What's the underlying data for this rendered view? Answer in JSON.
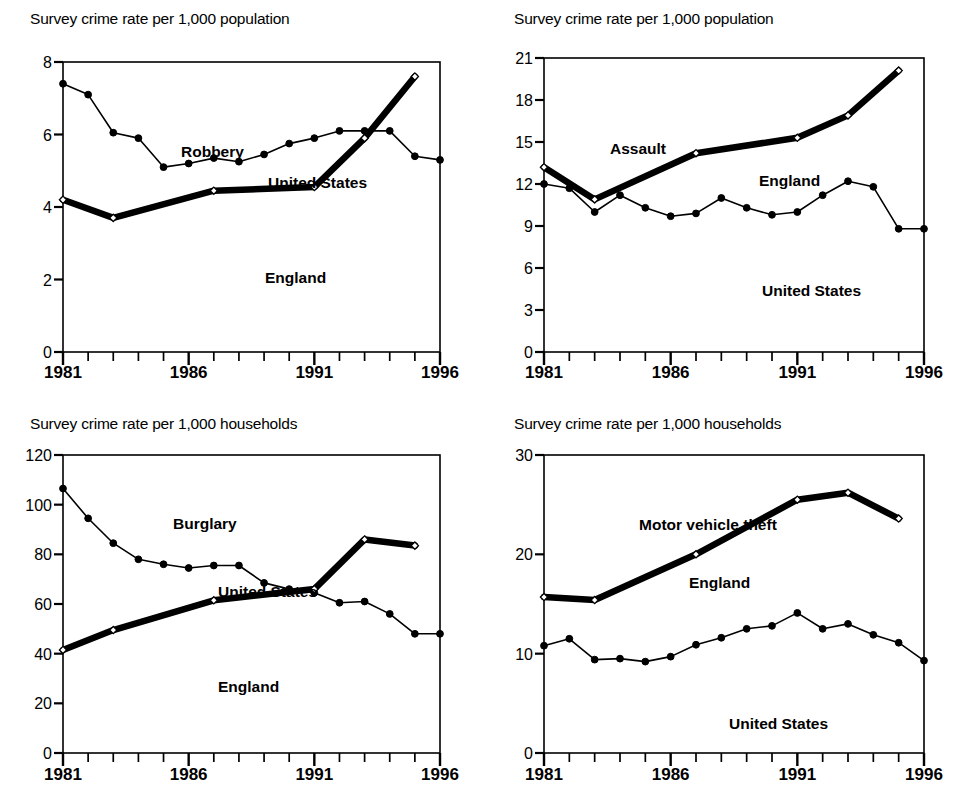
{
  "figure": {
    "background": "#ffffff",
    "ink": "#000000"
  },
  "panels": [
    {
      "id": "robbery",
      "axis_title": "Survey crime rate per 1,000 population",
      "heading": "Robbery",
      "labels": {
        "us": "United States",
        "england": "England"
      },
      "label_pos": {
        "heading_x": 118,
        "heading_y": 95,
        "us_x": 205,
        "us_y": 126,
        "england_x": 202,
        "england_y": 221
      }
    },
    {
      "id": "assault",
      "axis_title": "Survey crime rate per 1,000 population",
      "heading": "Assault",
      "labels": {
        "us": "United States",
        "england": "England"
      },
      "label_pos": {
        "heading_x": 66,
        "heading_y": 96,
        "england_x": 215,
        "england_y": 128,
        "us_x": 218,
        "us_y": 238
      }
    },
    {
      "id": "burglary",
      "axis_title": "Survey crime rate per 1,000 households",
      "heading": "Burglary",
      "labels": {
        "us": "United States",
        "england": "England"
      },
      "label_pos": {
        "heading_x": 110,
        "heading_y": 74,
        "us_x": 155,
        "us_y": 142,
        "england_x": 155,
        "england_y": 237
      }
    },
    {
      "id": "mvtheft",
      "axis_title": "Survey crime rate per 1,000 households",
      "heading": "Motor vehicle theft",
      "labels": {
        "us": "United States",
        "england": "England"
      },
      "label_pos": {
        "heading_x": 95,
        "heading_y": 75,
        "england_x": 145,
        "england_y": 133,
        "us_x": 185,
        "us_y": 274
      }
    }
  ],
  "chart_data": [
    {
      "type": "line",
      "id": "robbery",
      "title": "Robbery",
      "ylabel": "Survey crime rate per 1,000 population",
      "xlabel": "",
      "xlim": [
        1981,
        1996
      ],
      "ylim": [
        0,
        8
      ],
      "yticks": [
        0,
        2,
        4,
        6,
        8
      ],
      "xticks": [
        1981,
        1982,
        1983,
        1984,
        1985,
        1986,
        1987,
        1988,
        1989,
        1990,
        1991,
        1992,
        1993,
        1994,
        1995,
        1996
      ],
      "xticklabels": [
        "1981",
        "",
        "",
        "",
        "",
        "1986",
        "",
        "",
        "",
        "",
        "1991",
        "",
        "",
        "",
        "",
        "1996"
      ],
      "grid": false,
      "legend": "inline-annotations",
      "series": [
        {
          "name": "United States",
          "marker": "filled-circle",
          "line": "thin",
          "x": [
            1981,
            1982,
            1983,
            1984,
            1985,
            1986,
            1987,
            1988,
            1989,
            1990,
            1991,
            1992,
            1993,
            1994,
            1995,
            1996
          ],
          "values": [
            7.4,
            7.1,
            6.05,
            5.9,
            5.1,
            5.2,
            5.35,
            5.25,
            5.45,
            5.75,
            5.9,
            6.1,
            6.1,
            6.1,
            5.4,
            5.3
          ]
        },
        {
          "name": "England",
          "marker": "open-diamond",
          "line": "thick",
          "x": [
            1981,
            1983,
            1987,
            1991,
            1993,
            1995
          ],
          "values": [
            4.2,
            3.7,
            4.45,
            4.55,
            5.9,
            7.6
          ]
        }
      ]
    },
    {
      "type": "line",
      "id": "assault",
      "title": "Assault",
      "ylabel": "Survey crime rate per 1,000 population",
      "xlabel": "",
      "xlim": [
        1981,
        1996
      ],
      "ylim": [
        0,
        21
      ],
      "yticks": [
        0,
        3,
        6,
        9,
        12,
        15,
        18,
        21
      ],
      "xticks": [
        1981,
        1982,
        1983,
        1984,
        1985,
        1986,
        1987,
        1988,
        1989,
        1990,
        1991,
        1992,
        1993,
        1994,
        1995,
        1996
      ],
      "xticklabels": [
        "1981",
        "",
        "",
        "",
        "",
        "1986",
        "",
        "",
        "",
        "",
        "1991",
        "",
        "",
        "",
        "",
        "1996"
      ],
      "grid": false,
      "legend": "inline-annotations",
      "series": [
        {
          "name": "United States",
          "marker": "filled-circle",
          "line": "thin",
          "x": [
            1981,
            1982,
            1983,
            1984,
            1985,
            1986,
            1987,
            1988,
            1989,
            1990,
            1991,
            1992,
            1993,
            1994,
            1995,
            1996
          ],
          "values": [
            12.0,
            11.7,
            10.0,
            11.2,
            10.3,
            9.7,
            9.9,
            11.0,
            10.3,
            9.8,
            10.0,
            11.2,
            12.2,
            11.8,
            8.8,
            8.8
          ]
        },
        {
          "name": "England",
          "marker": "open-diamond",
          "line": "thick",
          "x": [
            1981,
            1983,
            1987,
            1991,
            1993,
            1995
          ],
          "values": [
            13.2,
            10.9,
            14.2,
            15.3,
            16.9,
            20.1
          ]
        }
      ]
    },
    {
      "type": "line",
      "id": "burglary",
      "title": "Burglary",
      "ylabel": "Survey crime rate per 1,000 households",
      "xlabel": "",
      "xlim": [
        1981,
        1996
      ],
      "ylim": [
        0,
        120
      ],
      "yticks": [
        0,
        20,
        40,
        60,
        80,
        100,
        120
      ],
      "xticks": [
        1981,
        1982,
        1983,
        1984,
        1985,
        1986,
        1987,
        1988,
        1989,
        1990,
        1991,
        1992,
        1993,
        1994,
        1995,
        1996
      ],
      "xticklabels": [
        "1981",
        "",
        "",
        "",
        "",
        "1986",
        "",
        "",
        "",
        "",
        "1991",
        "",
        "",
        "",
        "",
        "1996"
      ],
      "grid": false,
      "legend": "inline-annotations",
      "series": [
        {
          "name": "United States",
          "marker": "filled-circle",
          "line": "thin",
          "x": [
            1981,
            1982,
            1983,
            1984,
            1985,
            1986,
            1987,
            1988,
            1989,
            1990,
            1991,
            1992,
            1993,
            1994,
            1995,
            1996
          ],
          "values": [
            106.5,
            94.5,
            84.5,
            78.0,
            76.0,
            74.5,
            75.5,
            75.5,
            68.5,
            66.0,
            64.5,
            60.5,
            61.0,
            56.0,
            48.0,
            48.0
          ]
        },
        {
          "name": "England",
          "marker": "open-diamond",
          "line": "thick",
          "x": [
            1981,
            1983,
            1987,
            1991,
            1993,
            1995
          ],
          "values": [
            41.5,
            49.5,
            61.5,
            66.0,
            86.0,
            83.5
          ]
        }
      ]
    },
    {
      "type": "line",
      "id": "mvtheft",
      "title": "Motor vehicle theft",
      "ylabel": "Survey crime rate per 1,000 households",
      "xlabel": "",
      "xlim": [
        1981,
        1996
      ],
      "ylim": [
        0,
        30
      ],
      "yticks": [
        0,
        10,
        20,
        30
      ],
      "xticks": [
        1981,
        1982,
        1983,
        1984,
        1985,
        1986,
        1987,
        1988,
        1989,
        1990,
        1991,
        1992,
        1993,
        1994,
        1995,
        1996
      ],
      "xticklabels": [
        "1981",
        "",
        "",
        "",
        "",
        "1986",
        "",
        "",
        "",
        "",
        "1991",
        "",
        "",
        "",
        "",
        "1996"
      ],
      "grid": false,
      "legend": "inline-annotations",
      "series": [
        {
          "name": "United States",
          "marker": "filled-circle",
          "line": "thin",
          "x": [
            1981,
            1982,
            1983,
            1984,
            1985,
            1986,
            1987,
            1988,
            1989,
            1990,
            1991,
            1992,
            1993,
            1994,
            1995,
            1996
          ],
          "values": [
            10.8,
            11.5,
            9.4,
            9.5,
            9.2,
            9.7,
            10.9,
            11.6,
            12.5,
            12.8,
            14.1,
            12.5,
            13.0,
            11.9,
            11.1,
            9.3
          ]
        },
        {
          "name": "England",
          "marker": "open-diamond",
          "line": "thick",
          "x": [
            1981,
            1983,
            1987,
            1991,
            1993,
            1995
          ],
          "values": [
            15.7,
            15.4,
            20.0,
            25.5,
            26.2,
            23.6
          ]
        }
      ]
    }
  ]
}
